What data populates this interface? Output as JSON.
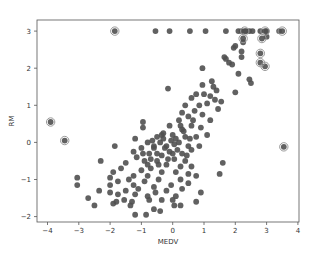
{
  "chart_data": {
    "type": "scatter",
    "title": "",
    "xlabel": "MEDV",
    "ylabel": "RM",
    "xlim": [
      -4.3,
      4.0
    ],
    "ylim": [
      -2.15,
      3.3
    ],
    "grid": false,
    "legend": null,
    "x_ticks": [
      -4,
      -3,
      -2,
      -1,
      0,
      1,
      2,
      3,
      4
    ],
    "y_ticks": [
      -2,
      -1,
      0,
      1,
      2,
      3
    ],
    "colors": {
      "point": "#505050",
      "outlier_ring": "#9a9a9a",
      "axes": "#555555"
    },
    "outliers_highlighted": [
      {
        "x": -3.9,
        "y": 0.55
      },
      {
        "x": -3.45,
        "y": 0.05
      },
      {
        "x": -1.85,
        "y": 3.0
      },
      {
        "x": 3.55,
        "y": -0.12
      },
      {
        "x": 2.25,
        "y": 2.8
      },
      {
        "x": 2.8,
        "y": 2.4
      },
      {
        "x": 2.8,
        "y": 2.15
      },
      {
        "x": 2.95,
        "y": 2.05
      },
      {
        "x": 2.85,
        "y": 2.8
      },
      {
        "x": 2.95,
        "y": 3.0
      },
      {
        "x": 3.5,
        "y": 3.0
      },
      {
        "x": 2.3,
        "y": 3.0
      }
    ],
    "points": [
      {
        "x": -0.55,
        "y": 3.0
      },
      {
        "x": -0.1,
        "y": 3.0
      },
      {
        "x": 0.55,
        "y": 3.0
      },
      {
        "x": 1.05,
        "y": 3.0
      },
      {
        "x": 1.7,
        "y": 3.0
      },
      {
        "x": 2.1,
        "y": 3.0
      },
      {
        "x": 2.2,
        "y": 3.0
      },
      {
        "x": 2.35,
        "y": 3.0
      },
      {
        "x": 2.45,
        "y": 3.0
      },
      {
        "x": 2.55,
        "y": 3.0
      },
      {
        "x": 2.8,
        "y": 3.0
      },
      {
        "x": 3.0,
        "y": 3.0
      },
      {
        "x": 3.4,
        "y": 3.0
      },
      {
        "x": 3.0,
        "y": 2.85
      },
      {
        "x": 2.25,
        "y": 2.7
      },
      {
        "x": 1.95,
        "y": 2.55
      },
      {
        "x": 2.0,
        "y": 2.6
      },
      {
        "x": 2.2,
        "y": 2.45
      },
      {
        "x": 2.2,
        "y": 2.3
      },
      {
        "x": 1.65,
        "y": 2.3
      },
      {
        "x": 1.7,
        "y": 2.25
      },
      {
        "x": 1.8,
        "y": 2.15
      },
      {
        "x": 1.9,
        "y": 2.1
      },
      {
        "x": 0.95,
        "y": 2.0
      },
      {
        "x": 2.1,
        "y": 1.85
      },
      {
        "x": 2.45,
        "y": 1.7
      },
      {
        "x": 2.5,
        "y": 1.6
      },
      {
        "x": 1.25,
        "y": 1.65
      },
      {
        "x": 1.3,
        "y": 1.5
      },
      {
        "x": 1.4,
        "y": 1.4
      },
      {
        "x": -0.15,
        "y": 1.45
      },
      {
        "x": 0.95,
        "y": 1.55
      },
      {
        "x": 1.0,
        "y": 1.3
      },
      {
        "x": 1.2,
        "y": 1.25
      },
      {
        "x": 2.0,
        "y": 1.35
      },
      {
        "x": 1.35,
        "y": 1.15
      },
      {
        "x": 1.55,
        "y": 1.1
      },
      {
        "x": 0.75,
        "y": 1.3
      },
      {
        "x": 0.6,
        "y": 1.2
      },
      {
        "x": 1.1,
        "y": 1.05
      },
      {
        "x": 0.85,
        "y": 1.0
      },
      {
        "x": 0.4,
        "y": 1.0
      },
      {
        "x": 1.45,
        "y": 0.9
      },
      {
        "x": 0.7,
        "y": 0.85
      },
      {
        "x": 0.3,
        "y": 0.8
      },
      {
        "x": 0.5,
        "y": 0.7
      },
      {
        "x": 0.95,
        "y": 0.75
      },
      {
        "x": 1.2,
        "y": 0.6
      },
      {
        "x": 0.2,
        "y": 0.6
      },
      {
        "x": -0.1,
        "y": 0.45
      },
      {
        "x": 0.6,
        "y": 0.45
      },
      {
        "x": -0.95,
        "y": 0.55
      },
      {
        "x": -0.95,
        "y": 0.4
      },
      {
        "x": 0.9,
        "y": 0.4
      },
      {
        "x": 0.3,
        "y": 0.35
      },
      {
        "x": 1.1,
        "y": 0.2
      },
      {
        "x": 0.75,
        "y": 0.15
      },
      {
        "x": -1.2,
        "y": 0.1
      },
      {
        "x": -0.3,
        "y": 0.25
      },
      {
        "x": 0.0,
        "y": 0.2
      },
      {
        "x": 0.4,
        "y": 0.15
      },
      {
        "x": -0.5,
        "y": 0.15
      },
      {
        "x": 0.2,
        "y": 0.0
      },
      {
        "x": -0.8,
        "y": 0.0
      },
      {
        "x": -0.4,
        "y": 0.0
      },
      {
        "x": 0.05,
        "y": -0.05
      },
      {
        "x": 0.5,
        "y": -0.1
      },
      {
        "x": 0.85,
        "y": -0.1
      },
      {
        "x": -1.0,
        "y": -0.15
      },
      {
        "x": -0.6,
        "y": -0.15
      },
      {
        "x": -0.2,
        "y": -0.1
      },
      {
        "x": -1.85,
        "y": -0.1
      },
      {
        "x": 0.6,
        "y": -0.2
      },
      {
        "x": -0.1,
        "y": -0.25
      },
      {
        "x": 0.3,
        "y": -0.3
      },
      {
        "x": -1.25,
        "y": -0.25
      },
      {
        "x": -0.75,
        "y": -0.3
      },
      {
        "x": -0.35,
        "y": -0.35
      },
      {
        "x": -1.15,
        "y": -0.4
      },
      {
        "x": 0.05,
        "y": -0.45
      },
      {
        "x": -0.9,
        "y": -0.5
      },
      {
        "x": -0.5,
        "y": -0.5
      },
      {
        "x": 0.4,
        "y": -0.5
      },
      {
        "x": -2.3,
        "y": -0.5
      },
      {
        "x": -1.5,
        "y": -0.55
      },
      {
        "x": 1.6,
        "y": -0.55
      },
      {
        "x": -0.2,
        "y": -0.6
      },
      {
        "x": 0.25,
        "y": -0.65
      },
      {
        "x": 0.6,
        "y": -0.65
      },
      {
        "x": -0.7,
        "y": -0.7
      },
      {
        "x": -1.65,
        "y": -0.7
      },
      {
        "x": -1.0,
        "y": -0.75
      },
      {
        "x": -0.35,
        "y": -0.8
      },
      {
        "x": 0.1,
        "y": -0.8
      },
      {
        "x": -1.9,
        "y": -0.8
      },
      {
        "x": 1.5,
        "y": -0.85
      },
      {
        "x": 0.5,
        "y": -0.85
      },
      {
        "x": -1.25,
        "y": -0.9
      },
      {
        "x": -0.8,
        "y": -0.9
      },
      {
        "x": 0.75,
        "y": -0.9
      },
      {
        "x": -2.0,
        "y": -0.95
      },
      {
        "x": -3.05,
        "y": -0.95
      },
      {
        "x": -0.45,
        "y": -1.0
      },
      {
        "x": -1.4,
        "y": -1.0
      },
      {
        "x": 0.25,
        "y": -1.0
      },
      {
        "x": -0.9,
        "y": -1.05
      },
      {
        "x": -1.75,
        "y": -1.05
      },
      {
        "x": 0.5,
        "y": -1.1
      },
      {
        "x": -0.05,
        "y": -1.15
      },
      {
        "x": -1.25,
        "y": -1.15
      },
      {
        "x": -3.05,
        "y": -1.15
      },
      {
        "x": -2.0,
        "y": -1.15
      },
      {
        "x": -0.6,
        "y": -1.2
      },
      {
        "x": -1.1,
        "y": -1.25
      },
      {
        "x": 0.3,
        "y": -1.25
      },
      {
        "x": -0.2,
        "y": -1.3
      },
      {
        "x": -1.5,
        "y": -1.3
      },
      {
        "x": -2.35,
        "y": -1.3
      },
      {
        "x": -0.55,
        "y": -1.35
      },
      {
        "x": 0.9,
        "y": -1.35
      },
      {
        "x": -2.0,
        "y": -1.35
      },
      {
        "x": -1.2,
        "y": -1.4
      },
      {
        "x": -1.75,
        "y": -1.4
      },
      {
        "x": -0.8,
        "y": -1.45
      },
      {
        "x": 0.1,
        "y": -1.45
      },
      {
        "x": -2.7,
        "y": -1.5
      },
      {
        "x": -0.35,
        "y": -1.55
      },
      {
        "x": -0.75,
        "y": -1.55
      },
      {
        "x": -1.55,
        "y": -1.55
      },
      {
        "x": 0.0,
        "y": -1.55
      },
      {
        "x": -1.8,
        "y": -1.6
      },
      {
        "x": -1.3,
        "y": -1.6
      },
      {
        "x": 0.75,
        "y": -1.6
      },
      {
        "x": -1.9,
        "y": -1.65
      },
      {
        "x": -2.5,
        "y": -1.7
      },
      {
        "x": -1.35,
        "y": -1.7
      },
      {
        "x": 0.05,
        "y": -1.7
      },
      {
        "x": 0.25,
        "y": -1.7
      },
      {
        "x": -0.6,
        "y": -1.8
      },
      {
        "x": -0.4,
        "y": -1.85
      },
      {
        "x": -1.2,
        "y": -1.95
      },
      {
        "x": -0.85,
        "y": -1.95
      },
      {
        "x": -0.6,
        "y": -0.1
      },
      {
        "x": -0.3,
        "y": 0.1
      },
      {
        "x": 0.1,
        "y": 0.1
      },
      {
        "x": -0.5,
        "y": -0.3
      },
      {
        "x": -0.15,
        "y": -0.45
      },
      {
        "x": -0.8,
        "y": -0.6
      },
      {
        "x": 0.35,
        "y": 0.3
      },
      {
        "x": 0.15,
        "y": -0.2
      },
      {
        "x": -0.25,
        "y": -0.15
      },
      {
        "x": 0.55,
        "y": 0.1
      },
      {
        "x": -0.05,
        "y": 0.05
      },
      {
        "x": -0.65,
        "y": 0.05
      },
      {
        "x": -0.45,
        "y": -0.6
      },
      {
        "x": -0.95,
        "y": -0.3
      },
      {
        "x": 0.25,
        "y": 0.45
      },
      {
        "x": 0.65,
        "y": 0.6
      },
      {
        "x": -0.35,
        "y": 0.2
      },
      {
        "x": 0.0,
        "y": -0.3
      },
      {
        "x": -0.7,
        "y": -0.45
      },
      {
        "x": 0.45,
        "y": -0.35
      }
    ]
  }
}
